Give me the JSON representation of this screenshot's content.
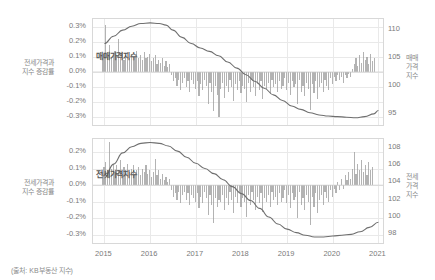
{
  "source_note": "(출처: KB부동산 지수)",
  "panels": [
    {
      "id": "top",
      "series_label": "매매가격지수",
      "left_axis_label": "전세가격과\n지수 증감률",
      "left_axis_label_line1": "전세가격과",
      "left_axis_label_line2": "지수 증감률",
      "right_axis_label_line1": "매매",
      "right_axis_label_line2": "가격",
      "right_axis_label_line3": "지수",
      "left_ticks": [
        "0.3%",
        "0.2%",
        "0.1%",
        "0.0%",
        "-0.1%",
        "-0.2%",
        "-0.3%"
      ],
      "right_ticks": [
        "110",
        "105",
        "100",
        "95"
      ]
    },
    {
      "id": "bottom",
      "series_label": "전세가격지수",
      "left_axis_label_line1": "전세가격과",
      "left_axis_label_line2": "지수 증감률",
      "right_axis_label_line1": "전세",
      "right_axis_label_line2": "가격",
      "right_axis_label_line3": "지수",
      "left_ticks": [
        "0.2%",
        "0.1%",
        "0.0%",
        "-0.1%",
        "-0.2%",
        "-0.3%"
      ],
      "right_ticks": [
        "108",
        "106",
        "104",
        "102",
        "100",
        "98"
      ]
    }
  ],
  "xticks": [
    "2015",
    "2016",
    "2017",
    "2018",
    "2019",
    "2020",
    "2021"
  ],
  "colors": {
    "bar": "#9a9a9a",
    "line": "#6f6f6f",
    "grid": "#e9e9e9",
    "frame": "#d8d8d8",
    "text": "#7a7a7a"
  },
  "chart_data": [
    {
      "type": "bar",
      "title": "매매가격지수",
      "xlabel": "",
      "ylabel": "전세가격과 지수 증감률",
      "y2label": "매매가격지수",
      "xlim": [
        2014.75,
        2021.1
      ],
      "ylim": [
        -0.0035,
        0.0035
      ],
      "y2lim": [
        93,
        112
      ],
      "ytick_labels": [
        "0.3%",
        "0.2%",
        "0.1%",
        "0.0%",
        "-0.1%",
        "-0.2%",
        "-0.3%"
      ],
      "ytick_values": [
        0.003,
        0.002,
        0.001,
        0.0,
        -0.001,
        -0.002,
        -0.003
      ],
      "y2tick_values": [
        110,
        105,
        100,
        95
      ],
      "xtick_values": [
        2015,
        2016,
        2017,
        2018,
        2019,
        2020,
        2021
      ],
      "grid": true,
      "legend": "none",
      "series": [
        {
          "name": "증감률",
          "kind": "bar",
          "axis": "left",
          "x": [
            2014.95,
            2014.99,
            2015.03,
            2015.07,
            2015.11,
            2015.15,
            2015.19,
            2015.23,
            2015.27,
            2015.31,
            2015.35,
            2015.39,
            2015.43,
            2015.47,
            2015.51,
            2015.55,
            2015.59,
            2015.63,
            2015.67,
            2015.71,
            2015.75,
            2015.79,
            2015.83,
            2015.87,
            2015.91,
            2015.95,
            2015.99,
            2016.03,
            2016.07,
            2016.11,
            2016.15,
            2016.19,
            2016.23,
            2016.27,
            2016.31,
            2016.35,
            2016.39,
            2016.43,
            2016.47,
            2016.51,
            2016.55,
            2016.59,
            2016.63,
            2016.67,
            2016.71,
            2016.75,
            2016.79,
            2016.83,
            2016.87,
            2016.91,
            2016.95,
            2016.99,
            2017.03,
            2017.07,
            2017.11,
            2017.15,
            2017.19,
            2017.23,
            2017.27,
            2017.31,
            2017.35,
            2017.39,
            2017.43,
            2017.47,
            2017.51,
            2017.55,
            2017.59,
            2017.63,
            2017.67,
            2017.71,
            2017.75,
            2017.79,
            2017.83,
            2017.87,
            2017.91,
            2017.95,
            2017.99,
            2018.03,
            2018.07,
            2018.11,
            2018.15,
            2018.19,
            2018.23,
            2018.27,
            2018.31,
            2018.35,
            2018.39,
            2018.43,
            2018.47,
            2018.51,
            2018.55,
            2018.59,
            2018.63,
            2018.67,
            2018.71,
            2018.75,
            2018.79,
            2018.83,
            2018.87,
            2018.91,
            2018.95,
            2018.99,
            2019.03,
            2019.07,
            2019.11,
            2019.15,
            2019.19,
            2019.23,
            2019.27,
            2019.31,
            2019.35,
            2019.39,
            2019.43,
            2019.47,
            2019.51,
            2019.55,
            2019.59,
            2019.63,
            2019.67,
            2019.71,
            2019.75,
            2019.79,
            2019.83,
            2019.87,
            2019.91,
            2019.95,
            2019.99,
            2020.03,
            2020.07,
            2020.11,
            2020.15,
            2020.19,
            2020.23,
            2020.27,
            2020.31,
            2020.35,
            2020.39,
            2020.43,
            2020.47,
            2020.51,
            2020.55,
            2020.59,
            2020.63,
            2020.67,
            2020.71,
            2020.75,
            2020.79,
            2020.83,
            2020.87,
            2020.91,
            2020.95,
            2020.99
          ],
          "values": [
            0.0009,
            0.0012,
            0.0031,
            0.001,
            0.0018,
            0.0009,
            0.0011,
            0.0014,
            0.001,
            0.0022,
            0.0009,
            0.0013,
            0.0008,
            0.0011,
            0.0013,
            0.0009,
            0.0012,
            0.0008,
            0.001,
            0.0014,
            0.0009,
            0.0011,
            0.0008,
            0.0013,
            0.0009,
            0.001,
            0.0012,
            0.0007,
            0.0009,
            0.0011,
            0.0005,
            0.0008,
            0.0006,
            0.0009,
            0.0004,
            0.0007,
            0.0003,
            0.0005,
            -0.0002,
            -0.0006,
            -0.0004,
            -0.0009,
            -0.0005,
            -0.0012,
            -0.0007,
            -0.0004,
            -0.001,
            -0.0006,
            -0.0013,
            -0.0005,
            -0.0008,
            -0.0011,
            -0.0006,
            -0.0016,
            -0.0008,
            -0.0012,
            -0.0005,
            -0.0009,
            -0.0021,
            -0.0007,
            -0.0013,
            -0.0026,
            -0.0009,
            -0.0015,
            -0.003,
            -0.0011,
            -0.0007,
            -0.0017,
            -0.0009,
            -0.0013,
            -0.0005,
            -0.001,
            -0.0019,
            -0.0008,
            -0.0012,
            -0.0006,
            -0.0014,
            -0.0009,
            -0.0011,
            -0.002,
            -0.0007,
            -0.0013,
            -0.0005,
            -0.001,
            -0.0016,
            -0.0008,
            -0.0012,
            -0.0006,
            -0.0018,
            -0.0009,
            -0.0011,
            -0.0007,
            -0.0014,
            -0.0005,
            -0.001,
            -0.0008,
            -0.0013,
            -0.0006,
            -0.0011,
            -0.0009,
            -0.0004,
            -0.0012,
            -0.0007,
            -0.0015,
            -0.0006,
            -0.001,
            -0.0008,
            -0.0021,
            -0.0005,
            -0.0013,
            -0.0009,
            -0.0016,
            -0.0007,
            -0.0011,
            -0.0025,
            -0.0008,
            -0.0014,
            -0.0006,
            -0.0018,
            -0.001,
            -0.0007,
            -0.0013,
            -0.0005,
            -0.0009,
            -0.0012,
            -0.0004,
            -0.0008,
            -0.0003,
            -0.0006,
            -0.0002,
            -0.0005,
            -0.0003,
            -0.0007,
            -0.0002,
            -0.0004,
            -0.0001,
            -0.0003,
            0.0002,
            0.0005,
            0.0009,
            0.0004,
            0.0011,
            0.0006,
            0.0013,
            0.0008,
            0.001,
            0.0005,
            0.0012,
            0.0007,
            0.0009
          ]
        },
        {
          "name": "매매가격지수",
          "kind": "line",
          "axis": "right",
          "x": [
            2015.0,
            2015.2,
            2015.4,
            2015.6,
            2015.8,
            2016.0,
            2016.2,
            2016.35,
            2016.5,
            2016.7,
            2016.9,
            2017.1,
            2017.3,
            2017.5,
            2017.7,
            2017.9,
            2018.1,
            2018.3,
            2018.5,
            2018.7,
            2018.9,
            2019.1,
            2019.3,
            2019.5,
            2019.7,
            2019.9,
            2020.1,
            2020.3,
            2020.5,
            2020.7,
            2020.9,
            2021.0
          ],
          "values": [
            107.6,
            108.9,
            110.0,
            110.7,
            111.2,
            111.3,
            111.2,
            110.9,
            110.0,
            108.7,
            107.6,
            106.8,
            106.2,
            105.4,
            104.3,
            103.2,
            102.0,
            100.8,
            99.6,
            98.4,
            97.4,
            96.4,
            95.8,
            95.2,
            94.8,
            94.6,
            94.5,
            94.4,
            94.3,
            94.5,
            95.0,
            95.6
          ]
        }
      ]
    },
    {
      "type": "bar",
      "title": "전세가격지수",
      "xlabel": "",
      "ylabel": "전세가격과 지수 증감률",
      "y2label": "전세가격지수",
      "xlim": [
        2014.75,
        2021.1
      ],
      "ylim": [
        -0.0035,
        0.0028
      ],
      "y2lim": [
        97,
        109
      ],
      "ytick_labels": [
        "0.2%",
        "0.1%",
        "0.0%",
        "-0.1%",
        "-0.2%",
        "-0.3%"
      ],
      "ytick_values": [
        0.002,
        0.001,
        0.0,
        -0.001,
        -0.002,
        -0.003
      ],
      "y2tick_values": [
        108,
        106,
        104,
        102,
        100,
        98
      ],
      "xtick_values": [
        2015,
        2016,
        2017,
        2018,
        2019,
        2020,
        2021
      ],
      "grid": true,
      "legend": "none",
      "series": [
        {
          "name": "증감률",
          "kind": "bar",
          "axis": "left",
          "x": [
            2014.95,
            2014.99,
            2015.03,
            2015.07,
            2015.11,
            2015.15,
            2015.19,
            2015.23,
            2015.27,
            2015.31,
            2015.35,
            2015.39,
            2015.43,
            2015.47,
            2015.51,
            2015.55,
            2015.59,
            2015.63,
            2015.67,
            2015.71,
            2015.75,
            2015.79,
            2015.83,
            2015.87,
            2015.91,
            2015.95,
            2015.99,
            2016.03,
            2016.07,
            2016.11,
            2016.15,
            2016.19,
            2016.23,
            2016.27,
            2016.31,
            2016.35,
            2016.39,
            2016.43,
            2016.47,
            2016.51,
            2016.55,
            2016.59,
            2016.63,
            2016.67,
            2016.71,
            2016.75,
            2016.79,
            2016.83,
            2016.87,
            2016.91,
            2016.95,
            2016.99,
            2017.03,
            2017.07,
            2017.11,
            2017.15,
            2017.19,
            2017.23,
            2017.27,
            2017.31,
            2017.35,
            2017.39,
            2017.43,
            2017.47,
            2017.51,
            2017.55,
            2017.59,
            2017.63,
            2017.67,
            2017.71,
            2017.75,
            2017.79,
            2017.83,
            2017.87,
            2017.91,
            2017.95,
            2017.99,
            2018.03,
            2018.07,
            2018.11,
            2018.15,
            2018.19,
            2018.23,
            2018.27,
            2018.31,
            2018.35,
            2018.39,
            2018.43,
            2018.47,
            2018.51,
            2018.55,
            2018.59,
            2018.63,
            2018.67,
            2018.71,
            2018.75,
            2018.79,
            2018.83,
            2018.87,
            2018.91,
            2018.95,
            2018.99,
            2019.03,
            2019.07,
            2019.11,
            2019.15,
            2019.19,
            2019.23,
            2019.27,
            2019.31,
            2019.35,
            2019.39,
            2019.43,
            2019.47,
            2019.51,
            2019.55,
            2019.59,
            2019.63,
            2019.67,
            2019.71,
            2019.75,
            2019.79,
            2019.83,
            2019.87,
            2019.91,
            2019.95,
            2019.99,
            2020.03,
            2020.07,
            2020.11,
            2020.15,
            2020.19,
            2020.23,
            2020.27,
            2020.31,
            2020.35,
            2020.39,
            2020.43,
            2020.47,
            2020.51,
            2020.55,
            2020.59,
            2020.63,
            2020.67,
            2020.71,
            2020.75,
            2020.79,
            2020.83,
            2020.87,
            2020.91,
            2020.95,
            2020.99
          ],
          "values": [
            0.0008,
            0.0011,
            0.0014,
            0.0009,
            0.0026,
            0.001,
            0.0013,
            0.0008,
            0.0012,
            0.0009,
            0.0015,
            0.0007,
            0.0011,
            0.0009,
            0.0013,
            0.0008,
            0.001,
            0.0012,
            0.0007,
            0.0009,
            0.0011,
            0.0006,
            0.001,
            0.0008,
            0.0012,
            0.0007,
            0.0009,
            0.0005,
            0.0008,
            0.0016,
            0.0006,
            0.0009,
            0.0004,
            0.0007,
            0.0003,
            0.0005,
            0.0002,
            0.0004,
            -0.0003,
            -0.0007,
            -0.0005,
            -0.0009,
            -0.0004,
            -0.0011,
            -0.0006,
            -0.0004,
            -0.0009,
            -0.0005,
            -0.0012,
            -0.0006,
            -0.0008,
            -0.001,
            -0.0005,
            -0.0014,
            -0.0007,
            -0.0011,
            -0.0004,
            -0.0008,
            -0.0018,
            -0.0006,
            -0.0012,
            -0.0023,
            -0.0008,
            -0.0013,
            -0.0009,
            -0.001,
            -0.0006,
            -0.0015,
            -0.0008,
            -0.0012,
            -0.0004,
            -0.0009,
            -0.0017,
            -0.0007,
            -0.0011,
            -0.0005,
            -0.0013,
            -0.0008,
            -0.001,
            -0.0019,
            -0.0006,
            -0.0012,
            -0.0004,
            -0.0009,
            -0.0015,
            -0.0007,
            -0.0011,
            -0.0005,
            -0.0016,
            -0.0008,
            -0.001,
            -0.0006,
            -0.0013,
            -0.0004,
            -0.0009,
            -0.0007,
            -0.0012,
            -0.0005,
            -0.001,
            -0.0008,
            -0.0003,
            -0.0011,
            -0.0006,
            -0.0014,
            -0.0005,
            -0.0009,
            -0.0007,
            -0.002,
            -0.0004,
            -0.0012,
            -0.0008,
            -0.0015,
            -0.0006,
            -0.001,
            -0.0024,
            -0.0007,
            -0.0013,
            -0.0005,
            -0.0017,
            -0.0009,
            -0.0006,
            -0.0012,
            -0.0004,
            -0.0008,
            -0.001,
            -0.0003,
            -0.0007,
            -0.0002,
            -0.0005,
            0.0002,
            -0.0003,
            0.0004,
            -0.0002,
            0.0006,
            0.0003,
            0.0008,
            0.0004,
            0.001,
            0.002,
            0.0007,
            0.0013,
            0.0009,
            0.0015,
            0.0008,
            0.0012,
            0.0006,
            0.0014,
            0.0009,
            0.0011
          ]
        },
        {
          "name": "전세가격지수",
          "kind": "line",
          "axis": "right",
          "x": [
            2015.0,
            2015.2,
            2015.4,
            2015.6,
            2015.8,
            2016.0,
            2016.2,
            2016.4,
            2016.6,
            2016.8,
            2017.0,
            2017.2,
            2017.4,
            2017.6,
            2017.8,
            2018.0,
            2018.2,
            2018.4,
            2018.6,
            2018.8,
            2019.0,
            2019.2,
            2019.4,
            2019.6,
            2019.8,
            2020.0,
            2020.2,
            2020.4,
            2020.6,
            2020.8,
            2021.0
          ],
          "values": [
            104.5,
            106.1,
            107.4,
            108.1,
            108.5,
            108.6,
            108.5,
            108.2,
            107.6,
            106.9,
            106.2,
            105.6,
            105.0,
            104.3,
            103.5,
            102.7,
            101.9,
            101.0,
            100.0,
            99.2,
            98.6,
            98.2,
            97.9,
            97.7,
            97.7,
            97.8,
            97.9,
            98.0,
            98.3,
            98.8,
            99.4
          ]
        }
      ]
    }
  ]
}
